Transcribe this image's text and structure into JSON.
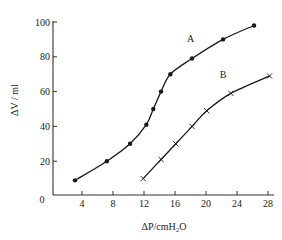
{
  "chart_data": {
    "type": "line",
    "title": "",
    "xlabel": "ΔP/cmH₂O",
    "ylabel": "ΔV / ml",
    "xlim": [
      0,
      29
    ],
    "ylim": [
      0,
      100
    ],
    "xticks": [
      4,
      8,
      12,
      16,
      20,
      24,
      28
    ],
    "yticks": [
      20,
      40,
      60,
      80,
      100
    ],
    "origin_label": "0",
    "grid": false,
    "legend": "inline labels",
    "series": [
      {
        "name": "A",
        "marker": "filled-circle",
        "x": [
          3.1,
          7.2,
          10.2,
          12.3,
          13.2,
          14.2,
          15.4,
          18.2,
          22.2,
          26.2
        ],
        "y": [
          9,
          20,
          30,
          41,
          50,
          60,
          70,
          79,
          90,
          98
        ],
        "label_pos": [
          18.0,
          91
        ]
      },
      {
        "name": "B",
        "marker": "cross",
        "x": [
          11.9,
          14.2,
          16.1,
          18.2,
          20.1,
          23.2,
          28.2
        ],
        "y": [
          10,
          21,
          30,
          40,
          49,
          59,
          69
        ],
        "label_pos": [
          22.2,
          70
        ]
      }
    ],
    "colors": {
      "line": "#1a1a1a",
      "axis": "#333333"
    }
  }
}
